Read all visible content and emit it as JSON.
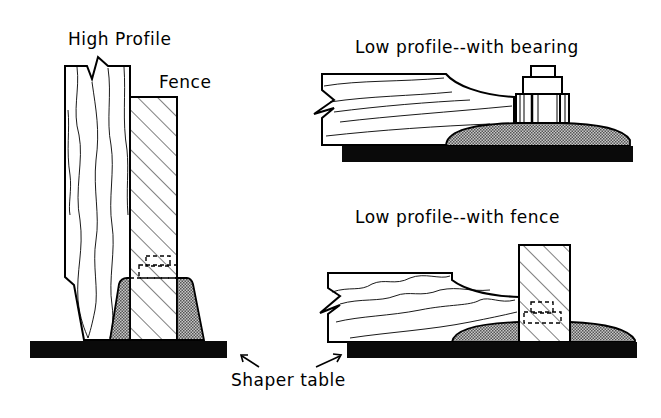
{
  "diagram": {
    "labels": {
      "high_profile": "High Profile",
      "fence": "Fence",
      "low_bearing": "Low profile--with bearing",
      "low_fence": "Low profile--with fence",
      "shaper_table": "Shaper table"
    },
    "panels": [
      {
        "name": "high-profile",
        "components": [
          "workpiece-vertical",
          "fence",
          "cutter",
          "shaper-table"
        ]
      },
      {
        "name": "low-profile-bearing",
        "components": [
          "workpiece-horizontal",
          "bearing",
          "nut",
          "cutter",
          "shaper-table"
        ]
      },
      {
        "name": "low-profile-fence",
        "components": [
          "workpiece-horizontal",
          "fence",
          "cutter",
          "shaper-table"
        ]
      }
    ],
    "colors": {
      "line": "#000000",
      "background": "#ffffff",
      "table": "#0a0a0a",
      "cutter_stipple": "#8c8c8c"
    }
  }
}
